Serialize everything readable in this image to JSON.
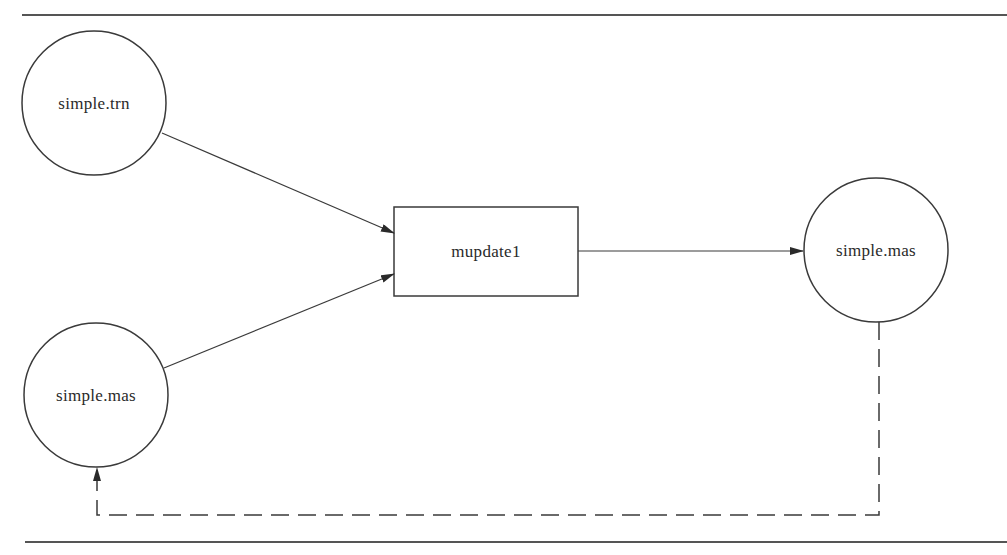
{
  "diagram": {
    "type": "data-flow",
    "nodes": [
      {
        "id": "trn_in",
        "shape": "circle",
        "label": "simple.trn",
        "cx": 94,
        "cy": 103,
        "r": 72
      },
      {
        "id": "mas_in",
        "shape": "circle",
        "label": "simple.mas",
        "cx": 96,
        "cy": 395,
        "r": 72
      },
      {
        "id": "process",
        "shape": "rectangle",
        "label": "mupdate1",
        "x": 394,
        "y": 207,
        "w": 184,
        "h": 89
      },
      {
        "id": "mas_out",
        "shape": "circle",
        "label": "simple.mas",
        "cx": 876,
        "cy": 250,
        "r": 72
      }
    ],
    "edges": [
      {
        "from": "trn_in",
        "to": "process",
        "style": "solid",
        "arrow": "end"
      },
      {
        "from": "mas_in",
        "to": "process",
        "style": "solid",
        "arrow": "end"
      },
      {
        "from": "process",
        "to": "mas_out",
        "style": "solid",
        "arrow": "end"
      },
      {
        "from": "mas_out",
        "to": "mas_in",
        "style": "dashed",
        "arrow": "end",
        "routing": "orthogonal-below"
      }
    ],
    "colors": {
      "line": "#3a3a3a",
      "text": "#2a2a2a",
      "background": "#ffffff",
      "rule": "#555555"
    }
  }
}
